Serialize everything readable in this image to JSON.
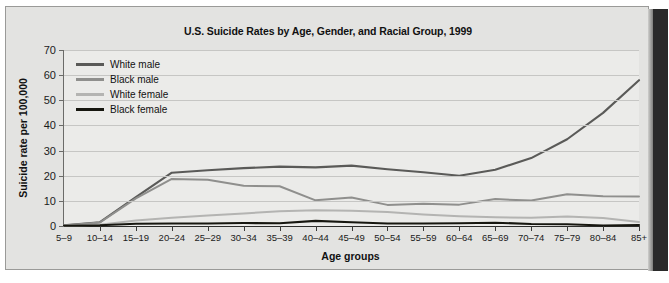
{
  "figure": {
    "title": "U.S. Suicide Rates by Age, Gender, and Racial Group, 1999",
    "x_axis_title": "Age groups",
    "y_axis_title": "Suicide rate per 100,000"
  },
  "colors": {
    "plot_background": "#ebebe9",
    "page_background": "#e3e3e1",
    "gridline": "#c6c6c4",
    "white_male": "#5a5a58",
    "black_male": "#8f8f8d",
    "white_female": "#b4b4b2",
    "black_female": "#16160f"
  },
  "chart_data": {
    "type": "line",
    "title": "U.S. Suicide Rates by Age, Gender, and Racial Group, 1999",
    "xlabel": "Age groups",
    "ylabel": "Suicide rate per 100,000",
    "ylim": [
      0,
      70
    ],
    "yticks": [
      0,
      10,
      20,
      30,
      40,
      50,
      60,
      70
    ],
    "grid": true,
    "legend_position": "top-left",
    "categories": [
      "5–9",
      "10–14",
      "15–19",
      "20–24",
      "25–29",
      "30–34",
      "35–39",
      "40–44",
      "45–49",
      "50–54",
      "55–59",
      "60–64",
      "65–69",
      "70–74",
      "75–79",
      "80–84",
      "85+"
    ],
    "series": [
      {
        "name": "White male",
        "color": "#5a5a58",
        "values": [
          0.3,
          1.5,
          11.5,
          21.2,
          22.2,
          23.0,
          23.6,
          23.3,
          24.0,
          22.6,
          21.4,
          20.0,
          22.4,
          27.0,
          34.5,
          45.0,
          58.0
        ]
      },
      {
        "name": "Black male",
        "color": "#8f8f8d",
        "values": [
          0.2,
          1.4,
          11.0,
          18.7,
          18.4,
          16.0,
          15.8,
          10.2,
          11.3,
          8.4,
          8.8,
          8.5,
          10.7,
          10.1,
          12.6,
          11.8,
          11.7
        ]
      },
      {
        "name": "White female",
        "color": "#b4b4b2",
        "values": [
          0.1,
          0.5,
          2.2,
          3.3,
          4.2,
          5.0,
          5.9,
          6.3,
          6.1,
          5.6,
          4.6,
          3.9,
          3.5,
          3.3,
          3.8,
          3.2,
          1.6
        ]
      },
      {
        "name": "Black female",
        "color": "#16160f",
        "values": [
          0.1,
          0.3,
          0.9,
          1.0,
          1.0,
          1.2,
          1.1,
          2.0,
          1.5,
          1.0,
          1.0,
          1.1,
          1.3,
          0.8,
          0.7,
          0.2,
          0.4
        ]
      }
    ]
  }
}
